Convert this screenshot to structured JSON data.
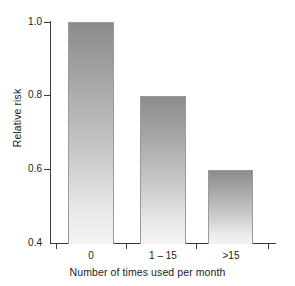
{
  "chart_data": {
    "type": "bar",
    "title": "",
    "subtitle": "",
    "xlabel": "Number of times used per month",
    "ylabel": "Relative risk",
    "categories": [
      "0",
      "1 – 15",
      ">15"
    ],
    "values": [
      1.0,
      0.8,
      0.6
    ],
    "ylim": [
      0.4,
      1.0
    ],
    "ytick_labels": [
      "1.0",
      "0.8",
      "0.6",
      "0.4"
    ],
    "ytick_values": [
      1.0,
      0.8,
      0.6,
      0.4
    ],
    "grid": false,
    "legend": null,
    "legend_position": "none",
    "series": [
      {
        "name": "Relative risk",
        "values": [
          1.0,
          0.8,
          0.6
        ]
      }
    ],
    "annotations": [],
    "bar_fill_top_color": "#8c8c8c",
    "bar_fill_bottom_color": "#f4f4f4",
    "bar_border_color": "#9a9a9a",
    "axis_color": "#3a3a3a",
    "background_color": "#ffffff"
  }
}
